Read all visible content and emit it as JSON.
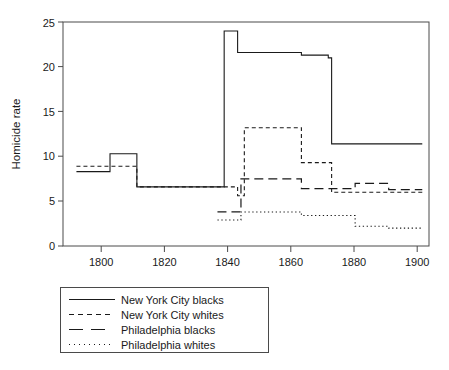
{
  "chart_data": {
    "type": "line",
    "title": "",
    "xlabel": "",
    "ylabel": "Homicide rate",
    "xlim": [
      1793,
      1902
    ],
    "ylim": [
      0,
      25
    ],
    "xticks": [
      1800,
      1820,
      1840,
      1860,
      1880,
      1900
    ],
    "yticks": [
      0,
      5,
      10,
      15,
      20,
      25
    ],
    "grid": false,
    "step": "post",
    "legend_position": "below-left",
    "line_color": "#1a1a1a",
    "series": [
      {
        "name": "New York City blacks",
        "style": "solid",
        "x": [
          1797,
          1807,
          1815,
          1841,
          1845,
          1864,
          1872,
          1900
        ],
        "y": [
          8.3,
          10.3,
          6.6,
          24.0,
          21.6,
          21.3,
          21.0,
          11.4
        ],
        "points": [
          {
            "x_start": 1797,
            "x_end": 1807,
            "value": 8.3
          },
          {
            "x_start": 1807,
            "x_end": 1815,
            "value": 10.3
          },
          {
            "x_start": 1815,
            "x_end": 1841,
            "value": 6.6
          },
          {
            "x_start": 1841,
            "x_end": 1845,
            "value": 24.0
          },
          {
            "x_start": 1845,
            "x_end": 1864,
            "value": 21.6
          },
          {
            "x_start": 1864,
            "x_end": 1872,
            "value": 21.3
          },
          {
            "x_start": 1872,
            "x_end": 1873,
            "value": 21.0
          },
          {
            "x_start": 1873,
            "x_end": 1900,
            "value": 11.4
          }
        ]
      },
      {
        "name": "New York City whites",
        "style": "dashed",
        "x": [
          1797,
          1815,
          1845,
          1847,
          1864,
          1880,
          1900
        ],
        "y": [
          8.9,
          6.6,
          5.6,
          13.2,
          9.3,
          6.0,
          6.0
        ],
        "points": [
          {
            "x_start": 1797,
            "x_end": 1815,
            "value": 8.9
          },
          {
            "x_start": 1815,
            "x_end": 1845,
            "value": 6.6
          },
          {
            "x_start": 1845,
            "x_end": 1847,
            "value": 5.6
          },
          {
            "x_start": 1847,
            "x_end": 1864,
            "value": 13.2
          },
          {
            "x_start": 1864,
            "x_end": 1873,
            "value": 9.3
          },
          {
            "x_start": 1873,
            "x_end": 1900,
            "value": 6.0
          }
        ]
      },
      {
        "name": "Philadelphia blacks",
        "style": "long-dashed",
        "x": [
          1839,
          1847,
          1864,
          1873,
          1888,
          1892,
          1900
        ],
        "y": [
          3.8,
          7.5,
          7.6,
          6.4,
          6.4,
          7.0,
          6.3
        ],
        "points": [
          {
            "x_start": 1839,
            "x_end": 1846,
            "value": 3.8
          },
          {
            "x_start": 1846,
            "x_end": 1864,
            "value": 7.5
          },
          {
            "x_start": 1864,
            "x_end": 1880,
            "value": 6.4
          },
          {
            "x_start": 1880,
            "x_end": 1890,
            "value": 7.0
          },
          {
            "x_start": 1890,
            "x_end": 1900,
            "value": 6.3
          }
        ]
      },
      {
        "name": "Philadelphia whites",
        "style": "dotted",
        "x": [
          1839,
          1846,
          1864,
          1880,
          1890,
          1900
        ],
        "y": [
          2.9,
          3.8,
          3.4,
          3.5,
          2.2,
          2.0
        ],
        "points": [
          {
            "x_start": 1839,
            "x_end": 1846,
            "value": 2.9
          },
          {
            "x_start": 1846,
            "x_end": 1864,
            "value": 3.8
          },
          {
            "x_start": 1864,
            "x_end": 1880,
            "value": 3.4
          },
          {
            "x_start": 1880,
            "x_end": 1890,
            "value": 2.2
          },
          {
            "x_start": 1890,
            "x_end": 1900,
            "value": 2.0
          }
        ]
      }
    ]
  },
  "axis": {
    "ylabel": "Homicide rate",
    "ytick_labels": [
      "0",
      "5",
      "10",
      "15",
      "20",
      "25"
    ],
    "xtick_labels": [
      "1800",
      "1820",
      "1840",
      "1860",
      "1880",
      "1900"
    ]
  },
  "legend": {
    "entries": [
      {
        "label": "New York City blacks",
        "style": "solid"
      },
      {
        "label": "New York City whites",
        "style": "dashed"
      },
      {
        "label": "Philadelphia blacks",
        "style": "long-dashed"
      },
      {
        "label": "Philadelphia whites",
        "style": "dotted"
      }
    ]
  }
}
